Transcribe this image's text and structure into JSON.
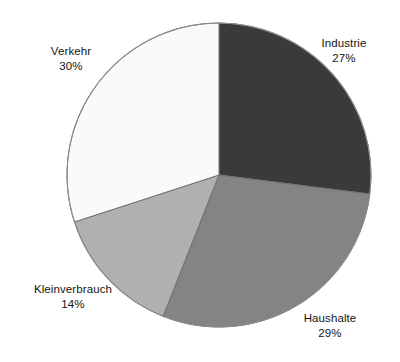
{
  "chart_data": {
    "type": "pie",
    "title": "",
    "subtitle": "",
    "xlabel": "",
    "ylabel": "",
    "grid": false,
    "legend_position": "none",
    "label_format": "name-above-percent",
    "units": "percent",
    "start_angle_deg": 0,
    "direction": "clockwise",
    "total": 100,
    "categories": [
      "Industrie",
      "Haushalte",
      "Kleinverbrauch",
      "Verkehr"
    ],
    "values": [
      27,
      29,
      14,
      30
    ],
    "slices": [
      {
        "name": "Industrie",
        "value": 27,
        "value_label": "27%",
        "color": "#3a3a3a",
        "start_deg": 0,
        "end_deg": 97.2
      },
      {
        "name": "Haushalte",
        "value": 29,
        "value_label": "29%",
        "color": "#848484",
        "start_deg": 97.2,
        "end_deg": 201.6
      },
      {
        "name": "Kleinverbrauch",
        "value": 14,
        "value_label": "14%",
        "color": "#b0b0b0",
        "start_deg": 201.6,
        "end_deg": 252.0
      },
      {
        "name": "Verkehr",
        "value": 30,
        "value_label": "30%",
        "color": "#fafafa",
        "start_deg": 252.0,
        "end_deg": 360.0
      }
    ],
    "geometry": {
      "center_x": 219,
      "center_y": 175,
      "radius": 152
    },
    "style": {
      "background": "#ffffff",
      "outline_color": "#8d8d8d",
      "divider_color": "#6f6f6f",
      "text_color": "#141414"
    }
  },
  "labels": {
    "industrie": {
      "name": "Industrie",
      "value": "27%"
    },
    "haushalte": {
      "name": "Haushalte",
      "value": "29%"
    },
    "kleinverbrauch": {
      "name": "Kleinverbrauch",
      "value": "14%"
    },
    "verkehr": {
      "name": "Verkehr",
      "value": "30%"
    }
  }
}
